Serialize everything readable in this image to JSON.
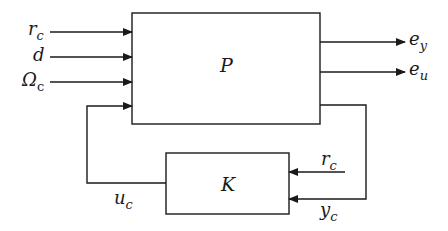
{
  "diagram": {
    "type": "block-diagram",
    "stroke_color": "#1a1a1a",
    "blocks": [
      {
        "id": "P",
        "label": "P"
      },
      {
        "id": "K",
        "label": "K"
      }
    ],
    "inputs_to_P": [
      {
        "base": "r",
        "sub": "c"
      },
      {
        "base": "d",
        "sub": ""
      },
      {
        "base": "Ω",
        "sub": "c"
      }
    ],
    "outputs_from_P": [
      {
        "base": "e",
        "sub": "y"
      },
      {
        "base": "e",
        "sub": "u"
      }
    ],
    "controller_inputs": [
      {
        "base": "r",
        "sub": "c"
      },
      {
        "base": "y",
        "sub": "c"
      }
    ],
    "controller_output": {
      "base": "u",
      "sub": "c"
    }
  }
}
